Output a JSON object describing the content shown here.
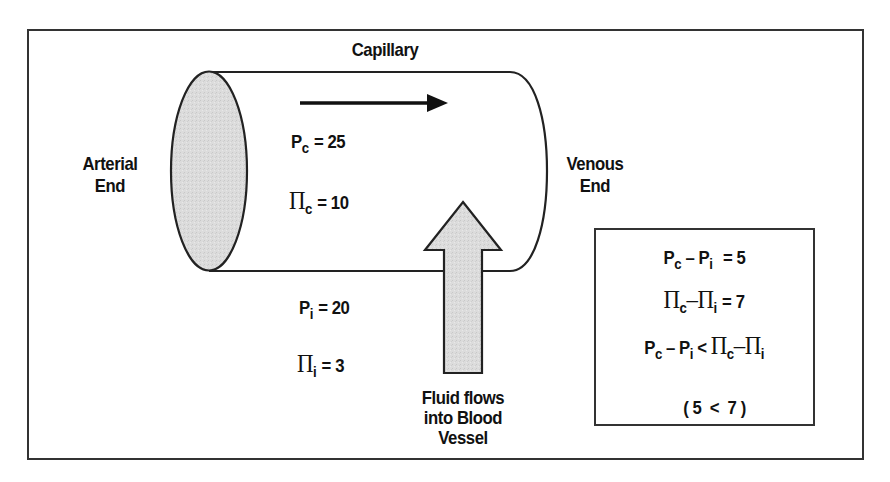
{
  "diagram": {
    "title": "Capillary",
    "left_label": [
      "Arterial",
      "End"
    ],
    "right_label": [
      "Venous",
      "End"
    ],
    "flow_direction_arrow": "left-to-right",
    "fluid_label": [
      "Fluid flows",
      "into Blood",
      "Vessel"
    ],
    "inside_values": {
      "pc": {
        "symbol": "P",
        "subscript": "c",
        "value": "= 25"
      },
      "pic": {
        "symbol": "Π",
        "subscript": "c",
        "value": "= 10"
      }
    },
    "outside_values": {
      "pi": {
        "symbol": "P",
        "subscript": "i",
        "value": "= 20"
      },
      "pii": {
        "symbol": "Π",
        "subscript": "i",
        "value": "= 3"
      }
    },
    "summary_box": {
      "line1": {
        "a": "P",
        "a_sub": "c",
        "op": "– P",
        "b_sub": "i",
        "result": "= 5"
      },
      "line2": {
        "a": "Π",
        "a_sub": "c",
        "op": "–Π",
        "b_sub": "i",
        "result": "= 7"
      },
      "line3": {
        "a": "P",
        "a_sub": "c",
        "op": "– P",
        "b_sub": "i",
        "cmp": "<",
        "c": "Π",
        "c_sub": "c",
        "op2": "–Π",
        "d_sub": "i"
      },
      "line4": "( 5  <  7 )"
    },
    "colors": {
      "stroke": "#222222",
      "fill_gray": "#d9d9d9",
      "background": "#ffffff"
    }
  }
}
